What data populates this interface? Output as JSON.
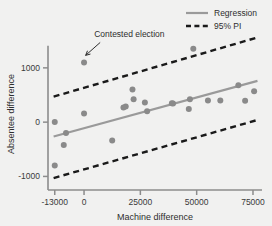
{
  "chart_data": {
    "type": "scatter",
    "title": "",
    "xlabel": "Machine difference",
    "ylabel": "Absentee difference",
    "xlim": [
      -16000,
      79000
    ],
    "ylim": [
      -1250,
      1550
    ],
    "xticks": [
      -13000,
      0,
      25000,
      50000,
      75000
    ],
    "xtick_labels": [
      "-13000",
      "0",
      "25000",
      "50000",
      "75000"
    ],
    "yticks": [
      -1000,
      0,
      1000
    ],
    "ytick_labels": [
      "-1000",
      "0",
      "1000"
    ],
    "grid": false,
    "legend_position": "top-right",
    "point_color": "#8a8a8a",
    "regression_color": "#9a9a9a",
    "interval_color": "#1a1a1a",
    "axis_color": "#8c8c8c",
    "background_color": "#f1f1f0",
    "points": [
      {
        "x": -13000,
        "y": -800
      },
      {
        "x": -13000,
        "y": 1
      },
      {
        "x": -9000,
        "y": -420
      },
      {
        "x": -8000,
        "y": -200
      },
      {
        "x": 0,
        "y": 1100,
        "label": "Contested election"
      },
      {
        "x": 0,
        "y": 160
      },
      {
        "x": 12500,
        "y": -340
      },
      {
        "x": 17500,
        "y": 270
      },
      {
        "x": 18500,
        "y": 290
      },
      {
        "x": 21500,
        "y": 600
      },
      {
        "x": 22000,
        "y": 420
      },
      {
        "x": 27000,
        "y": 360
      },
      {
        "x": 28000,
        "y": 200
      },
      {
        "x": 39000,
        "y": 350
      },
      {
        "x": 39500,
        "y": 345
      },
      {
        "x": 46500,
        "y": 240
      },
      {
        "x": 47000,
        "y": 420
      },
      {
        "x": 48500,
        "y": 1350
      },
      {
        "x": 55000,
        "y": 400
      },
      {
        "x": 60500,
        "y": 400
      },
      {
        "x": 68500,
        "y": 680
      },
      {
        "x": 71500,
        "y": 395
      },
      {
        "x": 75500,
        "y": 570
      }
    ],
    "series": [
      {
        "name": "Regression",
        "type": "line",
        "style": "solid",
        "color": "#9a9a9a",
        "x": [
          -13500,
          77000
        ],
        "y": [
          -265,
          760
        ]
      },
      {
        "name": "95% PI",
        "type": "line",
        "style": "dashed",
        "color": "#1a1a1a",
        "bound": "upper",
        "x": [
          -13500,
          77000
        ],
        "y": [
          470,
          1560
        ]
      },
      {
        "name": "95% PI",
        "type": "line",
        "style": "dashed",
        "color": "#1a1a1a",
        "bound": "lower",
        "x": [
          -13500,
          77000
        ],
        "y": [
          -1030,
          40
        ]
      }
    ],
    "annotations": [
      {
        "text": "Contested election",
        "text_x": 4500,
        "text_y": 1560,
        "arrow_to_x": 700,
        "arrow_to_y": 1230
      }
    ]
  },
  "legend": {
    "items": [
      {
        "label": "Regression",
        "style": "solid",
        "color": "#9a9a9a"
      },
      {
        "label": "95% PI",
        "style": "dashed",
        "color": "#1a1a1a"
      }
    ]
  }
}
